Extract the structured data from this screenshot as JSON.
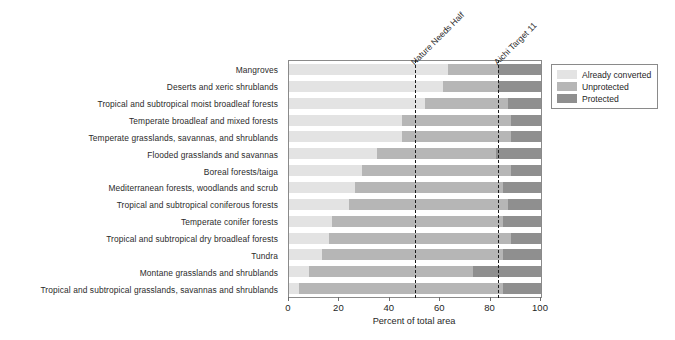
{
  "chart_data": {
    "type": "bar",
    "orientation": "horizontal",
    "stacked": true,
    "title": "",
    "xlabel": "Percent of total area",
    "ylabel": "",
    "xlim": [
      0,
      100
    ],
    "xticks": [
      0,
      20,
      40,
      60,
      80,
      100
    ],
    "grid": false,
    "legend_position": "top-right",
    "categories": [
      "Mangroves",
      "Deserts and xeric shrublands",
      "Tropical and subtropical moist broadleaf forests",
      "Temperate broadleaf and mixed forests",
      "Temperate grasslands, savannas, and shrublands",
      "Flooded grasslands and savannas",
      "Boreal forests/taiga",
      "Mediterranean forests, woodlands and scrub",
      "Tropical and subtropical coniferous forests",
      "Temperate conifer forests",
      "Tropical and subtropical dry broadleaf forests",
      "Tundra",
      "Montane grasslands and shrublands",
      "Tropical and subtropical grasslands, savannas and shrublands"
    ],
    "series": [
      {
        "name": "Already converted",
        "color": "#e3e3e3",
        "values": [
          63,
          61,
          54,
          45,
          45,
          35,
          29,
          26,
          24,
          17,
          16,
          13,
          8,
          4
        ]
      },
      {
        "name": "Unprotected",
        "color": "#b6b6b6",
        "values": [
          20,
          22,
          33,
          43,
          43,
          47,
          59,
          59,
          63,
          68,
          72,
          72,
          65,
          81
        ]
      },
      {
        "name": "Protected",
        "color": "#8f8f8f",
        "values": [
          17,
          17,
          13,
          12,
          12,
          18,
          12,
          15,
          13,
          15,
          12,
          15,
          27,
          15
        ]
      }
    ],
    "annotations": [
      {
        "label": "Nature Needs Half",
        "value": 50
      },
      {
        "label": "Aichi Target 11",
        "value": 83
      }
    ]
  },
  "legend": {
    "items": [
      {
        "label": "Already converted"
      },
      {
        "label": "Unprotected"
      },
      {
        "label": "Protected"
      }
    ]
  },
  "axis": {
    "x_title": "Percent of total area",
    "tick_labels": [
      "0",
      "20",
      "40",
      "60",
      "80",
      "100"
    ]
  }
}
